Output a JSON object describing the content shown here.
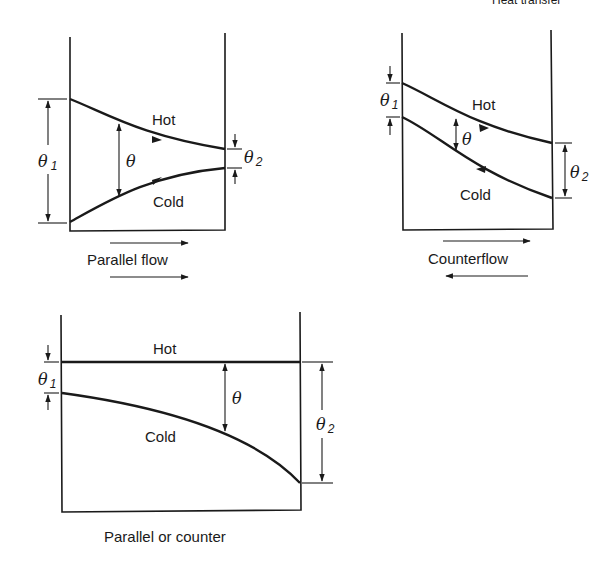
{
  "header": {
    "text": "Heat transfer"
  },
  "diagrams": [
    {
      "id": "parallel-flow",
      "caption": "Parallel flow",
      "hot_label": "Hot",
      "cold_label": "Cold",
      "theta_label": "θ",
      "theta1_label": "θ",
      "theta1_sub": "1",
      "theta2_label": "θ",
      "theta2_sub": "2",
      "flow_arrows": [
        "right",
        "right"
      ]
    },
    {
      "id": "counterflow",
      "caption": "Counterflow",
      "hot_label": "Hot",
      "cold_label": "Cold",
      "theta_label": "θ",
      "theta1_label": "θ",
      "theta1_sub": "1",
      "theta2_label": "θ",
      "theta2_sub": "2",
      "flow_arrows": [
        "right",
        "left"
      ]
    },
    {
      "id": "parallel-or-counter",
      "caption": "Parallel or counter",
      "hot_label": "Hot",
      "cold_label": "Cold",
      "theta_label": "θ",
      "theta1_label": "θ",
      "theta1_sub": "1",
      "theta2_label": "θ",
      "theta2_sub": "2",
      "flow_arrows": []
    }
  ],
  "colors": {
    "ink": "#1a1a1a",
    "background": "#ffffff"
  }
}
